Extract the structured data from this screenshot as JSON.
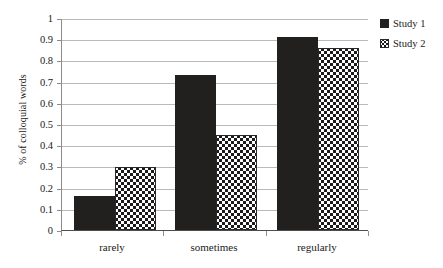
{
  "chart_data": {
    "type": "bar",
    "title": "",
    "xlabel": "",
    "ylabel": "% of colloquial words",
    "categories": [
      "rarely",
      "sometimes",
      "regularly"
    ],
    "series": [
      {
        "name": "Study 1",
        "values": [
          0.16,
          0.73,
          0.91
        ],
        "fill": "solid-black",
        "color": "#221f1f"
      },
      {
        "name": "Study 2",
        "values": [
          0.295,
          0.45,
          0.86
        ],
        "fill": "checkerboard",
        "color": "#1c1a1a"
      }
    ],
    "ylim": [
      0,
      1
    ],
    "ytick_values": [
      0,
      0.1,
      0.2,
      0.3,
      0.4,
      0.5,
      0.6,
      0.7,
      0.8,
      0.9,
      1
    ],
    "ytick_labels": [
      "0",
      "0.1",
      "0.2",
      "0.3",
      "0.4",
      "0.5",
      "0.6",
      "0.7",
      "0.8",
      "0.9",
      "1"
    ],
    "grid": "horizontal",
    "legend_position": "right-top",
    "gridline_color": "#b9b9b9",
    "axis_color": "#4d4d4d",
    "background": "#ffffff"
  },
  "legend": {
    "items": [
      {
        "label": "Study 1"
      },
      {
        "label": "Study 2"
      }
    ]
  }
}
